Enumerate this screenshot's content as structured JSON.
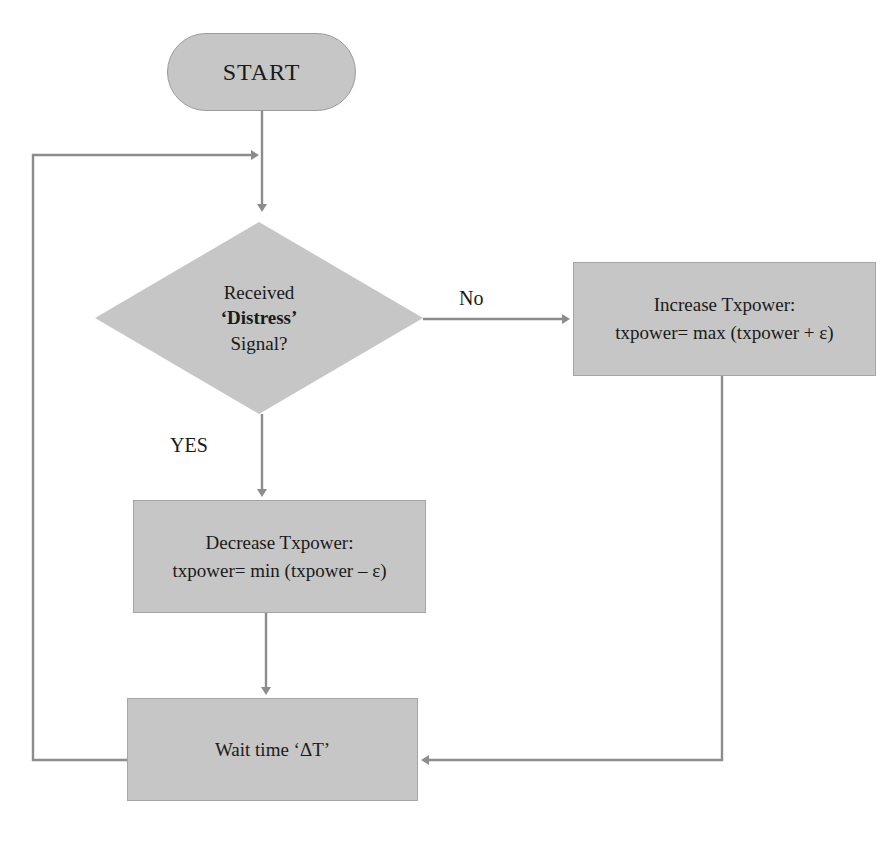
{
  "diagram": {
    "type": "flowchart",
    "theme": {
      "node_fill": "#c6c6c6",
      "node_stroke": "#9b9b9b",
      "edge_color": "#8c8c8c",
      "text_color": "#1a1a1a",
      "background": "#ffffff"
    },
    "nodes": [
      {
        "id": "start",
        "shape": "stadium",
        "label": "START"
      },
      {
        "id": "decision",
        "shape": "diamond",
        "line1": "Received",
        "line2": "‘Distress’",
        "line3": "Signal?"
      },
      {
        "id": "increase",
        "shape": "rectangle",
        "line1": "Increase Txpower:",
        "line2": "txpower= max (txpower + ε)"
      },
      {
        "id": "decrease",
        "shape": "rectangle",
        "line1": "Decrease Txpower:",
        "line2": "txpower= min (txpower – ε)"
      },
      {
        "id": "wait",
        "shape": "rectangle",
        "line1": "Wait time ‘ΔT’"
      }
    ],
    "edge_labels": {
      "no": "No",
      "yes": "YES"
    },
    "edges": [
      {
        "from": "start",
        "to": "decision",
        "label": ""
      },
      {
        "from": "decision",
        "to": "increase",
        "label": "No"
      },
      {
        "from": "decision",
        "to": "decrease",
        "label": "YES"
      },
      {
        "from": "decrease",
        "to": "wait",
        "label": ""
      },
      {
        "from": "increase",
        "to": "wait",
        "label": ""
      },
      {
        "from": "wait",
        "to": "decision",
        "label": ""
      }
    ]
  }
}
